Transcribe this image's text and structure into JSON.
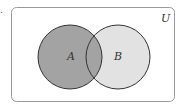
{
  "figure": {
    "prefix": ".",
    "universe_label": "U",
    "sets": [
      {
        "label": "A",
        "fill": "#a3a3a3"
      },
      {
        "label": "B",
        "fill": "#e2e2e2"
      }
    ],
    "intersection_fill": "#a3a3a3",
    "stroke": "#333333",
    "frame_stroke": "#999999"
  }
}
